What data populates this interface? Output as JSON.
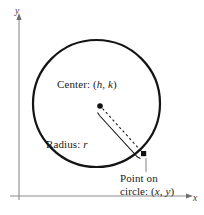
{
  "figure": {
    "labels": {
      "center": "Center: (h, k)",
      "center_prefix": "Center: (",
      "center_h": "h",
      "center_comma": ", ",
      "center_k": "k",
      "center_suffix": ")",
      "radius_prefix": "Radius: ",
      "radius_symbol": "r",
      "point_line1": "Point on",
      "point_prefix": "circle: (",
      "point_x": "x",
      "point_comma": ", ",
      "point_y": "y",
      "point_suffix": ")",
      "axis_y": "y",
      "axis_x": "x"
    },
    "colors": {
      "stroke": "#1a1a1a",
      "axis": "#8c8c8c",
      "leader": "#8c8c8c",
      "text": "#1a1a1a",
      "background": "#ffffff"
    },
    "geometry": {
      "circle_center_x": 96.5,
      "circle_center_y": 103.5,
      "circle_radius": 63.5,
      "center_dot_x": 100,
      "center_dot_y": 106,
      "center_dot_radius": 2.7,
      "point_marker_x": 143.5,
      "point_marker_y": 153.5,
      "point_marker_size": 5,
      "radius_dashed_from": "center",
      "radius_dashed_to": "point",
      "y_axis_x": 19,
      "y_axis_top": 16,
      "y_axis_bottom": 200,
      "x_axis_y": 196,
      "x_axis_left": 10,
      "x_axis_right": 196,
      "leader_line_x": 146,
      "leader_line_top": 158,
      "leader_line_bottom": 172
    }
  }
}
